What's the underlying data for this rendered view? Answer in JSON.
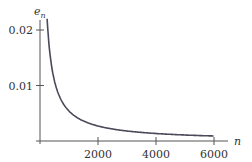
{
  "chart_data": {
    "type": "line",
    "title": "",
    "xlabel": "n",
    "ylabel": "e_n",
    "ylabel_base": "e",
    "ylabel_sub": "n",
    "xlim": [
      0,
      6200
    ],
    "ylim": [
      0,
      0.022
    ],
    "xticks": [
      2000,
      4000,
      6000
    ],
    "xtick_labels": [
      "2000",
      "4000",
      "6000"
    ],
    "yticks": [
      0.01,
      0.02
    ],
    "ytick_labels": [
      "0.01",
      "0.02"
    ],
    "grid": false,
    "legend": null,
    "series": [
      {
        "name": "e_n",
        "description": "Decreasing curve approximately proportional to 1/n, plotted for n up to 6000",
        "x": [
          250,
          300,
          400,
          500,
          600,
          800,
          1000,
          1250,
          1500,
          2000,
          2500,
          3000,
          3500,
          4000,
          4500,
          5000,
          5500,
          6000
        ],
        "y": [
          0.0215,
          0.018,
          0.0135,
          0.0108,
          0.009,
          0.0068,
          0.0054,
          0.0043,
          0.0036,
          0.0027,
          0.0022,
          0.0018,
          0.0015,
          0.00135,
          0.0012,
          0.0011,
          0.001,
          0.0009
        ],
        "color": "#4a4a5a"
      }
    ]
  }
}
